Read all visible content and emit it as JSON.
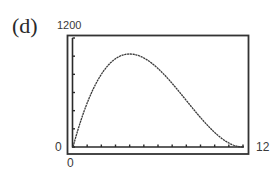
{
  "panel": {
    "label": "(d)"
  },
  "window": {
    "xmin_label": "0",
    "xmax_label": "12",
    "ymin_label": "0",
    "ymax_label": "1200"
  },
  "chart_data": {
    "type": "line",
    "title": "",
    "xlabel": "",
    "ylabel": "",
    "xlim": [
      0,
      12
    ],
    "ylim": [
      0,
      1200
    ],
    "xscale_ticks": 1,
    "yscale_ticks": 200,
    "grid": false,
    "legend": null,
    "function": "V = x(24 - 2x)^2",
    "series": [
      {
        "name": "V(x)",
        "x": [
          0,
          0.5,
          1,
          1.5,
          2,
          2.5,
          3,
          3.5,
          4,
          4.5,
          5,
          5.5,
          6,
          6.5,
          7,
          7.5,
          8,
          8.5,
          9,
          9.5,
          10,
          10.5,
          11,
          11.5,
          12
        ],
        "values": [
          0,
          264.5,
          484,
          661.5,
          800,
          902.5,
          972,
          1011.5,
          1024,
          1012.5,
          980,
          929.5,
          864,
          786.5,
          700,
          607.5,
          512,
          416.5,
          324,
          237.5,
          160,
          94.5,
          44,
          11.5,
          0
        ]
      }
    ],
    "max_point": {
      "x": 4,
      "y": 1024
    }
  },
  "colors": {
    "ink": "#2e2e2e",
    "background": "#ffffff"
  }
}
